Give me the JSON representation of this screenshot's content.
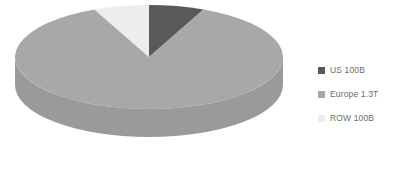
{
  "chart_data": {
    "type": "pie",
    "title": "",
    "subtitle": "",
    "xlabel": "",
    "ylabel": "",
    "three_d": true,
    "grid": false,
    "legend_position": "right",
    "categories": [
      "US 100B",
      "Europe 1.3T",
      "ROW 100B"
    ],
    "values": [
      100,
      1300,
      100
    ],
    "units": "USD (B = billion, T = trillion)",
    "total": 1500,
    "percentages": [
      6.7,
      86.7,
      6.7
    ],
    "slices": [
      {
        "label": "US 100B",
        "name": "US",
        "value": 100,
        "value_text": "100B",
        "percent": 6.7,
        "color": "#595959",
        "side_color": "#4a4a4a",
        "start_angle": 0,
        "end_angle": 24
      },
      {
        "label": "Europe 1.3T",
        "name": "Europe",
        "value": 1300,
        "value_text": "1.3T",
        "percent": 86.7,
        "color": "#a8a8a8",
        "side_color": "#9a9a9a",
        "start_angle": 24,
        "end_angle": 336
      },
      {
        "label": "ROW 100B",
        "name": "ROW",
        "value": 100,
        "value_text": "100B",
        "percent": 6.7,
        "color": "#ededed",
        "side_color": "#d6d6d6",
        "start_angle": 336,
        "end_angle": 360
      }
    ],
    "colors": {
      "background": "#ffffff",
      "legend_text": "#6b6b6b",
      "us": "#595959",
      "europe": "#a8a8a8",
      "row": "#ededed"
    }
  },
  "legend": {
    "items": [
      {
        "label": "US 100B",
        "color": "#595959"
      },
      {
        "label": "Europe 1.3T",
        "color": "#a6a6a6"
      },
      {
        "label": "ROW 100B",
        "color": "#ededed"
      }
    ]
  }
}
